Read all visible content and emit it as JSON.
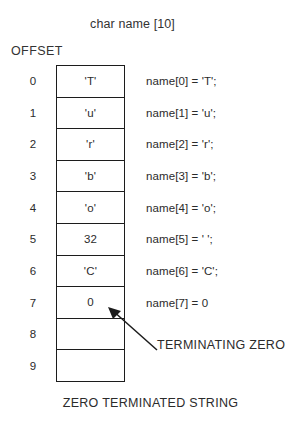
{
  "figure": {
    "title": "char name [10]",
    "offset_heading": "OFFSET",
    "caption": "ZERO TERMINATED STRING",
    "annotation": "TERMINATING ZERO",
    "colors": {
      "background": "#ffffff",
      "border": "#1c1c1c",
      "text": "#2b2b2b"
    }
  },
  "offsets": [
    "0",
    "1",
    "2",
    "3",
    "4",
    "5",
    "6",
    "7",
    "8",
    "9"
  ],
  "cells": [
    "'T'",
    "'u'",
    "'r'",
    "'b'",
    "'o'",
    "32",
    "'C'",
    "0",
    "",
    ""
  ],
  "assignments": [
    "name[0] = 'T';",
    "name[1] = 'u';",
    "name[2] = 'r';",
    "name[3] = 'b';",
    "name[4] = 'o';",
    "name[5] = ' ';",
    "name[6] = 'C';",
    "name[7] = 0"
  ],
  "icons": {
    "arrow": "arrow-up-left-icon"
  }
}
